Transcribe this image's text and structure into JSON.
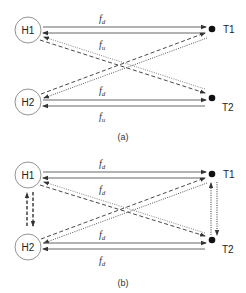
{
  "diagram_a": {
    "caption": "(a)",
    "nodes": {
      "h1": "H1",
      "h2": "H2",
      "t1": "T1",
      "t2": "T2"
    },
    "labels": {
      "top_upper": {
        "base": "f",
        "sub": "d"
      },
      "top_lower": {
        "base": "f",
        "sub": "u"
      },
      "bottom_upper": {
        "base": "f",
        "sub": "d"
      },
      "bottom_lower": {
        "base": "f",
        "sub": "u"
      }
    }
  },
  "diagram_b": {
    "caption": "(b)",
    "nodes": {
      "h1": "H1",
      "h2": "H2",
      "t1": "T1",
      "t2": "T2"
    },
    "labels": {
      "top_upper": {
        "base": "f",
        "sub": "d"
      },
      "top_lower": {
        "base": "f",
        "sub": "d"
      },
      "bottom_upper": {
        "base": "f",
        "sub": "d"
      },
      "bottom_lower": {
        "base": "f",
        "sub": "d"
      }
    }
  },
  "colors": {
    "line": "#444444",
    "circle_stroke": "#666666",
    "dot": "#111111"
  }
}
